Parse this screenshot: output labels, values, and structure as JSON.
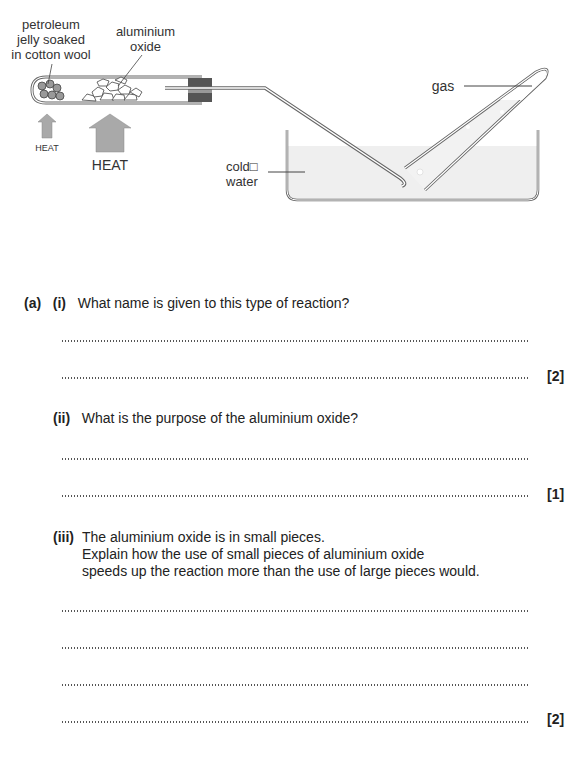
{
  "diagram": {
    "labels": {
      "petroleum": [
        "petroleum",
        "jelly soaked",
        "in cotton wool"
      ],
      "aluminium": [
        "aluminium",
        "oxide"
      ],
      "heat_small": "HEAT",
      "heat_large": "HEAT",
      "cold_water": [
        "cold□",
        "water"
      ],
      "gas": "gas"
    },
    "colors": {
      "arrow": "#a9a9a9",
      "bung": "#555555",
      "water": "#efefef",
      "line": "#666666"
    }
  },
  "questions": {
    "part": "(a)",
    "q1": {
      "num": "(i)",
      "text": "What name is given to this type of reaction?",
      "marks": "[2]"
    },
    "q2": {
      "num": "(ii)",
      "text": "What is the purpose of the aluminium oxide?",
      "marks": "[1]"
    },
    "q3": {
      "num": "(iii)",
      "lines": [
        "The aluminium oxide is in small pieces.",
        "Explain how the use of small pieces of aluminium oxide",
        "speeds up the reaction more than the use of large pieces would."
      ],
      "marks": "[2]"
    }
  }
}
